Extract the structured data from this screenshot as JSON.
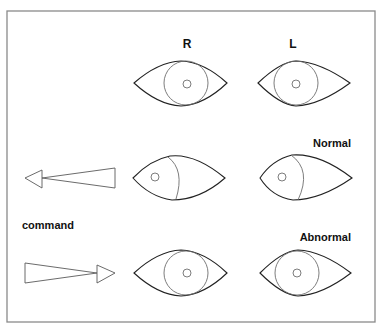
{
  "figure": {
    "column_labels": {
      "right": "R",
      "left": "L"
    },
    "row_labels": {
      "normal": "Normal",
      "abnormal": "Abnormal"
    },
    "command_label": "command",
    "rows": [
      {
        "id": "primary",
        "description": "eyes in primary position",
        "right_eye_gaze": "center",
        "left_eye_gaze": "center"
      },
      {
        "id": "normal",
        "label": "Normal",
        "command_direction": "left",
        "right_eye_gaze": "left",
        "left_eye_gaze": "left"
      },
      {
        "id": "abnormal",
        "label": "Abnormal",
        "command_direction": "right",
        "right_eye_gaze": "center",
        "left_eye_gaze": "center"
      }
    ],
    "icons": {
      "left_arrow": "arrow-left-icon",
      "right_arrow": "arrow-right-icon"
    },
    "colors": {
      "frame": "#8a8a8a",
      "lid": "#222222",
      "iris": "#6e6e6e",
      "text": "#111111"
    }
  }
}
